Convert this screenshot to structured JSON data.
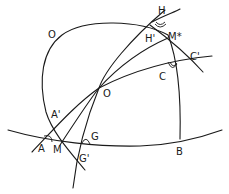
{
  "diagram": {
    "type": "spherical-geometry",
    "labels": {
      "O_top": "O",
      "O_center": "O",
      "H": "H",
      "H_prime": "H'",
      "M_star": "M*",
      "C_prime": "C'",
      "C": "C",
      "A_prime": "A'",
      "A": "A",
      "M": "M",
      "G": "G",
      "G_prime": "G'",
      "B": "B"
    },
    "colors": {
      "ink": "#1a1a1a",
      "background": "#ffffff"
    }
  }
}
